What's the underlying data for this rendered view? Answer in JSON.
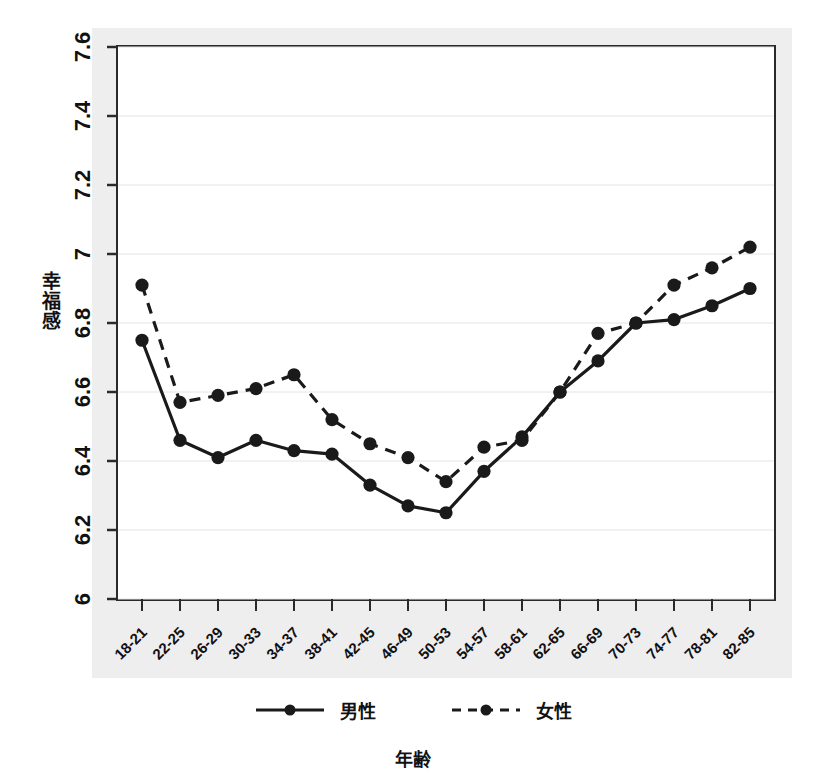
{
  "chart_data": {
    "type": "line",
    "title": "",
    "xlabel": "年齢",
    "ylabel": "幸福感",
    "categories": [
      "18-21",
      "22-25",
      "26-29",
      "30-33",
      "34-37",
      "38-41",
      "42-45",
      "46-49",
      "50-53",
      "54-57",
      "58-61",
      "62-65",
      "66-69",
      "70-73",
      "74-77",
      "78-81",
      "82-85"
    ],
    "ylim": [
      6,
      7.6
    ],
    "yticks": [
      "6",
      "6.2",
      "6.4",
      "6.6",
      "6.8",
      "7",
      "7.2",
      "7.4",
      "7.6"
    ],
    "ytick_values": [
      6,
      6.2,
      6.4,
      6.6,
      6.8,
      7,
      7.2,
      7.4,
      7.6
    ],
    "grid": true,
    "legend_position": "bottom",
    "series": [
      {
        "name": "男性",
        "style": "solid",
        "marker": "circle",
        "color": "#1a1a1a",
        "values": [
          6.75,
          6.46,
          6.41,
          6.46,
          6.43,
          6.42,
          6.33,
          6.27,
          6.25,
          6.37,
          6.47,
          6.6,
          6.69,
          6.8,
          6.81,
          6.85,
          6.9
        ]
      },
      {
        "name": "女性",
        "style": "dashed",
        "marker": "circle",
        "color": "#1a1a1a",
        "values": [
          6.91,
          6.57,
          6.59,
          6.61,
          6.65,
          6.52,
          6.45,
          6.41,
          6.34,
          6.44,
          6.46,
          6.6,
          6.77,
          6.8,
          6.91,
          6.96,
          7.02
        ]
      }
    ]
  },
  "axes": {
    "y_label": "幸福感",
    "x_label": "年齢"
  },
  "legend": {
    "items": [
      {
        "label": "男性",
        "style": "solid"
      },
      {
        "label": "女性",
        "style": "dashed"
      }
    ]
  },
  "colors": {
    "ink": "#1a1a1a",
    "plot_background": "#ffffff",
    "page_background": "#eeeeee",
    "grid": "#e4e4e4"
  }
}
